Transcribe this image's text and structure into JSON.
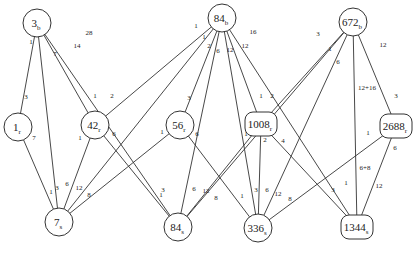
{
  "diagram": {
    "type": "bipartite-incidence-graph",
    "nodes": [
      {
        "id": "3b",
        "main": "3",
        "sub": "b",
        "shape": "circle",
        "x": 37,
        "y": 23,
        "r": 14
      },
      {
        "id": "84b",
        "main": "84",
        "sub": "b",
        "shape": "circle",
        "x": 222,
        "y": 18,
        "r": 14
      },
      {
        "id": "672b",
        "main": "672",
        "sub": "b",
        "shape": "circle",
        "x": 353,
        "y": 22,
        "r": 14
      },
      {
        "id": "1r",
        "main": "1",
        "sub": "r",
        "shape": "circle",
        "x": 18,
        "y": 127,
        "r": 14
      },
      {
        "id": "42r",
        "main": "42",
        "sub": "r",
        "shape": "circle",
        "x": 95,
        "y": 125,
        "r": 14
      },
      {
        "id": "56r",
        "main": "56",
        "sub": "r",
        "shape": "circle",
        "x": 180,
        "y": 125,
        "r": 14
      },
      {
        "id": "1008r",
        "main": "1008",
        "sub": "r",
        "shape": "rounded",
        "x": 261,
        "y": 124,
        "w": 32,
        "h": 24
      },
      {
        "id": "2688r",
        "main": "2688",
        "sub": "r",
        "shape": "rounded",
        "x": 396,
        "y": 126,
        "w": 32,
        "h": 24
      },
      {
        "id": "7s",
        "main": "7",
        "sub": "s",
        "shape": "circle",
        "x": 59,
        "y": 222,
        "r": 14
      },
      {
        "id": "84s",
        "main": "84",
        "sub": "s",
        "shape": "circle",
        "x": 178,
        "y": 227,
        "r": 14
      },
      {
        "id": "336s",
        "main": "336",
        "sub": "s",
        "shape": "circle",
        "x": 258,
        "y": 228,
        "r": 14
      },
      {
        "id": "1344s",
        "main": "1344",
        "sub": "s",
        "shape": "rounded",
        "x": 357,
        "y": 227,
        "w": 32,
        "h": 24
      }
    ],
    "edges": [
      {
        "from": "3b",
        "to": "1r",
        "label_from": "1",
        "label_to": "3",
        "lf": [
          31,
          44
        ],
        "lt": [
          26,
          99
        ]
      },
      {
        "from": "3b",
        "to": "7s",
        "label_from": "7",
        "label_to": "3",
        "lf": [
          55,
          56
        ],
        "lt": [
          57,
          190
        ]
      },
      {
        "from": "3b",
        "to": "42r",
        "label_from": "14",
        "label_to": "1",
        "lf": [
          77,
          48
        ],
        "lt": [
          95,
          98
        ]
      },
      {
        "from": "3b",
        "to": "84s",
        "label_from": "28",
        "label_to": "1",
        "lf": [
          89,
          35
        ],
        "lt": [
          161,
          197
        ]
      },
      {
        "from": "1r",
        "to": "7s",
        "label_from": "7",
        "label_to": "1",
        "lf": [
          34,
          140
        ],
        "lt": [
          51,
          194
        ]
      },
      {
        "from": "42r",
        "to": "7s",
        "label_from": "1",
        "label_to": "6",
        "lf": [
          80,
          140
        ],
        "lt": [
          67,
          186
        ]
      },
      {
        "from": "84b",
        "to": "42r",
        "label_from": "1",
        "label_to": "2",
        "lf": [
          196,
          28
        ],
        "lt": [
          112,
          98
        ]
      },
      {
        "from": "84b",
        "to": "7s",
        "label_from": "1",
        "label_to": "12",
        "lf": [
          204,
          39
        ],
        "lt": [
          79,
          190
        ]
      },
      {
        "from": "84b",
        "to": "56r",
        "label_from": "2",
        "label_to": "3",
        "lf": [
          209,
          48
        ],
        "lt": [
          189,
          100
        ]
      },
      {
        "from": "84b",
        "to": "84s",
        "label_from": "6",
        "label_to": "12",
        "lf": [
          218,
          53
        ],
        "lt": [
          206,
          193
        ]
      },
      {
        "from": "84b",
        "to": "336s",
        "label_from": "12",
        "label_to": "3",
        "lf": [
          230,
          52
        ],
        "lt": [
          256,
          192
        ]
      },
      {
        "from": "84b",
        "to": "1008r",
        "label_from": "12",
        "label_to": "1",
        "lf": [
          245,
          48
        ],
        "lt": [
          261,
          98
        ]
      },
      {
        "from": "84b",
        "to": "1344s",
        "label_from": "16",
        "label_to": "1",
        "lf": [
          253,
          34
        ],
        "lt": [
          346,
          185
        ]
      },
      {
        "from": "42r",
        "to": "84s",
        "label_from": "6",
        "label_to": "3",
        "lf": [
          114,
          136
        ],
        "lt": [
          163,
          192
        ]
      },
      {
        "from": "56r",
        "to": "7s",
        "label_from": "1",
        "label_to": "8",
        "lf": [
          162,
          134
        ],
        "lt": [
          89,
          197
        ]
      },
      {
        "from": "56r",
        "to": "336s",
        "label_from": "6",
        "label_to": "1",
        "lf": [
          197,
          136
        ],
        "lt": [
          242,
          198
        ]
      },
      {
        "from": "1008r",
        "to": "84s",
        "label_from": "1",
        "label_to": "6",
        "lf": [
          246,
          136
        ],
        "lt": [
          194,
          191
        ]
      },
      {
        "from": "1008r",
        "to": "336s",
        "label_from": "2",
        "label_to": "6",
        "lf": [
          265,
          142
        ],
        "lt": [
          267,
          192
        ]
      },
      {
        "from": "1008r",
        "to": "1344s",
        "label_from": "4",
        "label_to": "3",
        "lf": [
          283,
          143
        ],
        "lt": [
          333,
          192
        ]
      },
      {
        "from": "672b",
        "to": "1008r",
        "label_from": "3",
        "label_to": "2",
        "lf": [
          318,
          36
        ],
        "lt": [
          272,
          98
        ]
      },
      {
        "from": "672b",
        "to": "84s",
        "label_from": "1",
        "label_to": "8",
        "lf": [
          330,
          51
        ],
        "lt": [
          216,
          200
        ]
      },
      {
        "from": "672b",
        "to": "336s",
        "label_from": "6",
        "label_to": "12",
        "lf": [
          338,
          64
        ],
        "lt": [
          278,
          196
        ]
      },
      {
        "from": "672b",
        "to": "1344s",
        "label_from": "12+16",
        "label_to": "6+8",
        "lf": [
          367,
          90
        ],
        "lt": [
          365,
          170
        ]
      },
      {
        "from": "672b",
        "to": "2688r",
        "label_from": "12",
        "label_to": "3",
        "lf": [
          383,
          47
        ],
        "lt": [
          396,
          98
        ]
      },
      {
        "from": "2688r",
        "to": "336s",
        "label_from": "1",
        "label_to": "8",
        "lf": [
          368,
          135
        ],
        "lt": [
          290,
          201
        ]
      },
      {
        "from": "2688r",
        "to": "1344s",
        "label_from": "6",
        "label_to": "12",
        "lf": [
          395,
          150
        ],
        "lt": [
          379,
          188
        ]
      }
    ]
  }
}
